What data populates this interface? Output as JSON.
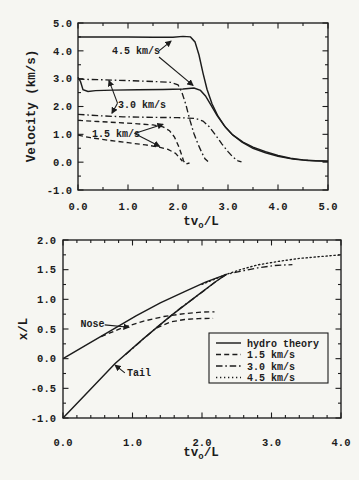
{
  "figure": {
    "ink_color": "#1c1c1c",
    "paper_color": "#f6f6f2"
  },
  "chart_data": [
    {
      "id": "velocity-plot",
      "type": "line",
      "title": "",
      "xlabel_parts": [
        {
          "t": "tv"
        },
        {
          "t": "o",
          "sub": true
        },
        {
          "t": "/L"
        }
      ],
      "ylabel": "Velocity (km/s)",
      "xlim": [
        0,
        5
      ],
      "ylim": [
        -1,
        5
      ],
      "grid": false,
      "x_minor_step": 0.5,
      "y_minor_step": 0.5,
      "xticks": [
        {
          "v": 0,
          "label": "0.0"
        },
        {
          "v": 1,
          "label": "1.0"
        },
        {
          "v": 2,
          "label": "2.0"
        },
        {
          "v": 3,
          "label": "3.0"
        },
        {
          "v": 4,
          "label": "4.0"
        },
        {
          "v": 5,
          "label": "5.0"
        }
      ],
      "yticks": [
        {
          "v": -1,
          "label": "-1.0"
        },
        {
          "v": 0,
          "label": "0.0"
        },
        {
          "v": 1,
          "label": "1.0"
        },
        {
          "v": 2,
          "label": "2.0"
        },
        {
          "v": 3,
          "label": "3.0"
        },
        {
          "v": 4,
          "label": "4.0"
        },
        {
          "v": 5,
          "label": "5.0"
        }
      ],
      "series": [
        {
          "name": "4.5 km/s shock velocity",
          "style": "solid",
          "points": [
            [
              0,
              4.5
            ],
            [
              0.5,
              4.5
            ],
            [
              1.0,
              4.5
            ],
            [
              1.5,
              4.49
            ],
            [
              1.9,
              4.49
            ],
            [
              2.1,
              4.52
            ],
            [
              2.25,
              4.5
            ],
            [
              2.34,
              4.32
            ],
            [
              2.42,
              3.85
            ],
            [
              2.5,
              3.2
            ],
            [
              2.58,
              2.62
            ],
            [
              2.68,
              2.1
            ],
            [
              2.8,
              1.65
            ],
            [
              2.95,
              1.25
            ],
            [
              3.1,
              0.97
            ],
            [
              3.3,
              0.72
            ],
            [
              3.5,
              0.54
            ],
            [
              3.75,
              0.38
            ],
            [
              4.0,
              0.24
            ],
            [
              4.25,
              0.14
            ],
            [
              4.5,
              0.08
            ],
            [
              4.75,
              0.05
            ],
            [
              5.0,
              0.04
            ]
          ]
        },
        {
          "name": "4.5 km/s nose velocity",
          "style": "solid",
          "points": [
            [
              0,
              3.05
            ],
            [
              0.05,
              2.9
            ],
            [
              0.1,
              2.6
            ],
            [
              0.2,
              2.54
            ],
            [
              0.35,
              2.57
            ],
            [
              0.7,
              2.59
            ],
            [
              1.2,
              2.6
            ],
            [
              1.7,
              2.61
            ],
            [
              2.1,
              2.63
            ],
            [
              2.32,
              2.66
            ],
            [
              2.45,
              2.58
            ],
            [
              2.55,
              2.38
            ],
            [
              2.66,
              2.05
            ],
            [
              2.78,
              1.68
            ],
            [
              2.92,
              1.32
            ],
            [
              3.08,
              1.0
            ],
            [
              3.28,
              0.72
            ],
            [
              3.5,
              0.5
            ],
            [
              3.75,
              0.34
            ],
            [
              4.0,
              0.21
            ],
            [
              4.3,
              0.11
            ],
            [
              4.6,
              0.06
            ],
            [
              5.0,
              0.03
            ]
          ]
        },
        {
          "name": "3.0 km/s shock velocity",
          "style": "dashdot",
          "points": [
            [
              0,
              2.98
            ],
            [
              0.5,
              2.96
            ],
            [
              1.0,
              2.93
            ],
            [
              1.5,
              2.9
            ],
            [
              1.85,
              2.87
            ],
            [
              2.0,
              2.78
            ],
            [
              2.08,
              2.5
            ],
            [
              2.16,
              2.05
            ],
            [
              2.24,
              1.5
            ],
            [
              2.32,
              1.02
            ],
            [
              2.4,
              0.65
            ],
            [
              2.48,
              0.33
            ],
            [
              2.54,
              0.12
            ],
            [
              2.6,
              0.02
            ]
          ]
        },
        {
          "name": "3.0 km/s nose velocity",
          "style": "dashdot",
          "points": [
            [
              0,
              1.72
            ],
            [
              0.4,
              1.67
            ],
            [
              0.9,
              1.63
            ],
            [
              1.5,
              1.61
            ],
            [
              2.0,
              1.6
            ],
            [
              2.35,
              1.57
            ],
            [
              2.5,
              1.48
            ],
            [
              2.62,
              1.28
            ],
            [
              2.75,
              0.98
            ],
            [
              2.88,
              0.65
            ],
            [
              3.0,
              0.38
            ],
            [
              3.1,
              0.18
            ],
            [
              3.2,
              0.05
            ],
            [
              3.27,
              0.01
            ]
          ]
        },
        {
          "name": "1.5 km/s shock velocity",
          "style": "dashed",
          "points": [
            [
              0,
              1.5
            ],
            [
              0.4,
              1.46
            ],
            [
              0.8,
              1.42
            ],
            [
              1.2,
              1.38
            ],
            [
              1.5,
              1.34
            ],
            [
              1.7,
              1.27
            ],
            [
              1.83,
              1.13
            ],
            [
              1.93,
              0.9
            ],
            [
              2.01,
              0.58
            ],
            [
              2.07,
              0.28
            ],
            [
              2.11,
              0.05
            ],
            [
              2.15,
              -0.07
            ],
            [
              2.23,
              -0.03
            ]
          ]
        },
        {
          "name": "1.5 km/s nose velocity",
          "style": "dashed",
          "points": [
            [
              0,
              0.97
            ],
            [
              0.25,
              0.88
            ],
            [
              0.6,
              0.79
            ],
            [
              1.0,
              0.7
            ],
            [
              1.35,
              0.62
            ],
            [
              1.6,
              0.55
            ],
            [
              1.8,
              0.46
            ],
            [
              1.95,
              0.32
            ],
            [
              2.03,
              0.16
            ],
            [
              2.09,
              0.03
            ]
          ]
        }
      ],
      "annotations": [
        {
          "text": "4.5 km/s",
          "at": [
            0.68,
            3.87
          ],
          "anchor": "start",
          "arrows": [
            {
              "from": [
                1.62,
                4.0
              ],
              "to": [
                1.86,
                4.35
              ]
            },
            {
              "from": [
                1.62,
                3.78
              ],
              "to": [
                2.3,
                2.76
              ]
            }
          ]
        },
        {
          "text": "3.0 km/s",
          "at": [
            0.8,
            1.95
          ],
          "anchor": "start",
          "arrows": [
            {
              "from": [
                0.79,
                2.12
              ],
              "to": [
                0.62,
                2.93
              ]
            },
            {
              "from": [
                0.79,
                2.12
              ],
              "to": [
                0.68,
                1.76
              ]
            }
          ]
        },
        {
          "text": "1.5 km/s",
          "at": [
            0.28,
            0.9
          ],
          "anchor": "start",
          "arrows": [
            {
              "from": [
                1.13,
                1.03
              ],
              "to": [
                1.7,
                1.36
              ]
            },
            {
              "from": [
                1.13,
                1.03
              ],
              "to": [
                1.63,
                0.57
              ]
            }
          ]
        }
      ],
      "legend": null
    },
    {
      "id": "position-plot",
      "type": "line",
      "title": "",
      "xlabel_parts": [
        {
          "t": "tv"
        },
        {
          "t": "o",
          "sub": true
        },
        {
          "t": "/L"
        }
      ],
      "ylabel": "x/L",
      "xlim": [
        0,
        4
      ],
      "ylim": [
        -1,
        2
      ],
      "grid": false,
      "x_minor_step": 0.2,
      "y_minor_step": 0.25,
      "xticks": [
        {
          "v": 0,
          "label": "0.0"
        },
        {
          "v": 1,
          "label": "1.0"
        },
        {
          "v": 2,
          "label": "2.0"
        },
        {
          "v": 3,
          "label": "3.0"
        },
        {
          "v": 4,
          "label": "4.0"
        }
      ],
      "yticks": [
        {
          "v": -1,
          "label": "-1.0"
        },
        {
          "v": -0.5,
          "label": "-0.5"
        },
        {
          "v": 0,
          "label": "0.0"
        },
        {
          "v": 0.5,
          "label": "0.5"
        },
        {
          "v": 1,
          "label": "1.0"
        },
        {
          "v": 1.5,
          "label": "1.5"
        },
        {
          "v": 2,
          "label": "2.0"
        }
      ],
      "series": [
        {
          "name": "hydro theory nose",
          "style": "solid",
          "points": [
            [
              0,
              0
            ],
            [
              0.35,
              0.24
            ],
            [
              0.7,
              0.48
            ],
            [
              1.05,
              0.72
            ],
            [
              1.4,
              0.94
            ],
            [
              1.75,
              1.13
            ],
            [
              2.05,
              1.29
            ],
            [
              2.35,
              1.42
            ]
          ]
        },
        {
          "name": "hydro theory tail",
          "style": "solid",
          "points": [
            [
              0,
              -1
            ],
            [
              0.375,
              -0.54
            ],
            [
              0.75,
              -0.08
            ],
            [
              1.15,
              0.33
            ],
            [
              1.55,
              0.72
            ],
            [
              1.95,
              1.08
            ],
            [
              2.2,
              1.3
            ],
            [
              2.35,
              1.42
            ]
          ]
        },
        {
          "name": "1.5 km/s nose",
          "style": "dashed",
          "points": [
            [
              0.55,
              0.37
            ],
            [
              0.85,
              0.52
            ],
            [
              1.15,
              0.63
            ],
            [
              1.45,
              0.71
            ],
            [
              1.75,
              0.76
            ],
            [
              2.0,
              0.785
            ],
            [
              2.18,
              0.79
            ]
          ]
        },
        {
          "name": "1.5 km/s tail",
          "style": "dashed",
          "points": [
            [
              1.35,
              0.52
            ],
            [
              1.55,
              0.62
            ],
            [
              1.75,
              0.66
            ],
            [
              1.95,
              0.675
            ],
            [
              2.16,
              0.68
            ]
          ]
        },
        {
          "name": "3.0 km/s",
          "style": "dashdot",
          "points": [
            [
              0.9,
              0.07
            ],
            [
              1.3,
              0.48
            ],
            [
              1.7,
              0.86
            ],
            [
              2.0,
              1.12
            ],
            [
              2.2,
              1.3
            ],
            [
              2.35,
              1.42
            ],
            [
              2.55,
              1.47
            ],
            [
              2.8,
              1.53
            ],
            [
              3.05,
              1.57
            ],
            [
              3.3,
              1.585
            ]
          ]
        },
        {
          "name": "4.5 km/s",
          "style": "dotted",
          "points": [
            [
              2.0,
              1.25
            ],
            [
              2.2,
              1.35
            ],
            [
              2.35,
              1.42
            ],
            [
              2.55,
              1.5
            ],
            [
              2.8,
              1.58
            ],
            [
              3.1,
              1.64
            ],
            [
              3.4,
              1.69
            ],
            [
              3.7,
              1.72
            ],
            [
              4.0,
              1.75
            ]
          ]
        }
      ],
      "annotations": [
        {
          "text": "Nose",
          "at": [
            0.25,
            0.54
          ],
          "anchor": "start",
          "arrows": [
            {
              "from": [
                0.6,
                0.57
              ],
              "to": [
                0.95,
                0.53
              ]
            }
          ]
        },
        {
          "text": "Tail",
          "at": [
            0.92,
            -0.3
          ],
          "anchor": "start",
          "arrows": [
            {
              "from": [
                0.89,
                -0.24
              ],
              "to": [
                0.75,
                -0.11
              ]
            }
          ]
        }
      ],
      "legend": {
        "position": "right-center",
        "entries": [
          {
            "style": "solid",
            "label": "hydro theory"
          },
          {
            "style": "dashed",
            "label": "1.5 km/s"
          },
          {
            "style": "dashdot",
            "label": "3.0 km/s"
          },
          {
            "style": "dotted",
            "label": "4.5 km/s"
          }
        ]
      }
    }
  ]
}
